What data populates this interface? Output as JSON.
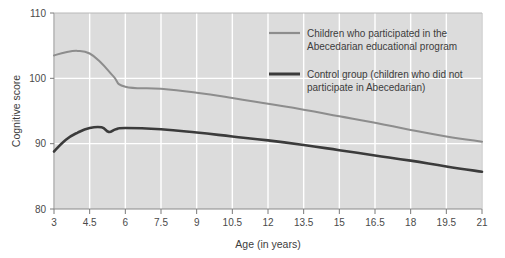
{
  "chart_data": {
    "type": "line",
    "title": "",
    "xlabel": "Age (in years)",
    "ylabel": "Cognitive score",
    "xlim": [
      3,
      21
    ],
    "ylim": [
      80,
      110
    ],
    "grid": true,
    "legend_position": "top-right-inside",
    "x_ticks": [
      "3",
      "4.5",
      "6",
      "7.5",
      "9",
      "10.5",
      "12",
      "13.5",
      "15",
      "16.5",
      "18",
      "19.5",
      "21"
    ],
    "y_ticks": [
      "80",
      "90",
      "100",
      "110"
    ],
    "series": [
      {
        "name": "Children who participated in the Abecedarian educational program",
        "color": "#8d8d8d",
        "x": [
          3,
          3.5,
          4,
          4.5,
          5,
          5.5,
          6,
          7.5,
          9,
          10.5,
          12,
          13.5,
          15,
          16.5,
          18,
          19.5,
          21
        ],
        "values": [
          103.5,
          104.0,
          104.2,
          103.8,
          102.3,
          100.3,
          98.7,
          98.4,
          97.8,
          97.0,
          96.1,
          95.2,
          94.2,
          93.2,
          92.1,
          91.1,
          90.3
        ]
      },
      {
        "name": "Control group (children who did not participate in Abecedarian)",
        "color": "#3b3b3b",
        "x": [
          3,
          3.5,
          4,
          4.5,
          5,
          5.3,
          5.6,
          6,
          7.5,
          9,
          10.5,
          12,
          13.5,
          15,
          16.5,
          18,
          19.5,
          21
        ],
        "values": [
          88.8,
          90.6,
          91.7,
          92.4,
          92.5,
          91.8,
          92.2,
          92.4,
          92.2,
          91.7,
          91.1,
          90.5,
          89.8,
          89.0,
          88.2,
          87.4,
          86.5,
          85.7
        ]
      }
    ]
  },
  "legend": {
    "items": [
      {
        "line1": "Children who participated in the",
        "line2": "Abecedarian educational program",
        "color": "#8d8d8d"
      },
      {
        "line1": "Control group (children who did not",
        "line2": "participate in Abecedarian)",
        "color": "#3b3b3b"
      }
    ]
  },
  "colors": {
    "plot_background": "#dcdcdc",
    "gridline": "#ffffff",
    "axis": "#7a7a7a",
    "text": "#3d3d3d"
  }
}
